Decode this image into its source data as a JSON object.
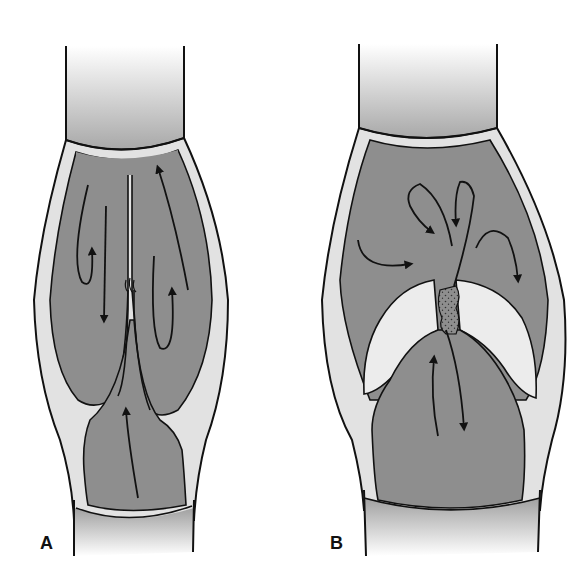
{
  "figure": {
    "panels": [
      {
        "label": "A",
        "state": "closed-valve",
        "flow_arrows": [
          "down-left",
          "up-loop-left",
          "up-right",
          "up-loop-right",
          "up-center-below-valve"
        ]
      },
      {
        "label": "B",
        "state": "incompetent-valve",
        "flow_arrows": [
          "loop-down-left",
          "loop-down-center",
          "right-inward-left",
          "loop-down-right",
          "up-through-valve",
          "down-through-valve"
        ]
      }
    ],
    "colors": {
      "blood_fill": "#8e8e8e",
      "vessel_wall": "#e2e2e2",
      "outline": "#111111",
      "cusp_fill": "#ececec",
      "tube_gradient_dark": "#a9a9a9",
      "tube_gradient_light": "#ffffff"
    }
  }
}
